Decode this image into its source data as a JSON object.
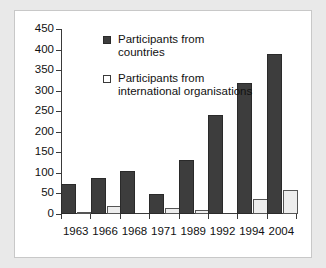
{
  "chart_data": {
    "type": "bar",
    "title": "",
    "xlabel": "",
    "ylabel": "",
    "ylim": [
      0,
      450
    ],
    "ytick_step": 50,
    "yticks": [
      "450",
      "400",
      "350",
      "300",
      "250",
      "200",
      "150",
      "100",
      "50",
      "0"
    ],
    "grid": false,
    "legend_position": "inside upper-left",
    "categories": [
      "1963",
      "1966",
      "1968",
      "1971",
      "1989",
      "1992",
      "1994",
      "2004"
    ],
    "series": [
      {
        "name": "Participants from countries",
        "key": "countries",
        "color": "#3d3d3d",
        "values": [
          72,
          88,
          105,
          49,
          131,
          241,
          318,
          389
        ]
      },
      {
        "name": "Participants from international organisations",
        "key": "orgs",
        "color": "#ededed",
        "values": [
          4,
          19,
          0,
          15,
          9,
          0,
          36,
          59
        ]
      }
    ]
  },
  "legend": {
    "items": [
      {
        "swatch": "countries",
        "label": "Participants from countries"
      },
      {
        "swatch": "orgs",
        "label": "Participants from international organisations"
      }
    ]
  },
  "colors": {
    "page_background": "#e9e9e9",
    "panel_background": "#ffffff",
    "panel_border": "#c8c8c8",
    "axis": "#3a3a3a",
    "text": "#111111",
    "series_countries": "#3d3d3d",
    "series_orgs": "#ededed"
  }
}
